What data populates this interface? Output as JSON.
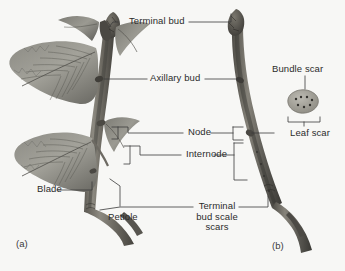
{
  "figure": {
    "type": "botany-twig-diagram",
    "background_color": "#f7f7f5",
    "ink_color": "#2b2b2b",
    "panels": [
      {
        "id": "a",
        "label": "(a)",
        "description": "leafy twig with blade and petiole"
      },
      {
        "id": "b",
        "label": "(b)",
        "description": "bare winter twig"
      }
    ],
    "labels": [
      {
        "id": "terminal-bud",
        "text": "Terminal bud"
      },
      {
        "id": "axillary-bud",
        "text": "Axillary bud"
      },
      {
        "id": "node",
        "text": "Node"
      },
      {
        "id": "internode",
        "text": "Internode"
      },
      {
        "id": "blade",
        "text": "Blade"
      },
      {
        "id": "petiole",
        "text": "Petiole"
      },
      {
        "id": "bundle-scar",
        "text": "Bundle scar"
      },
      {
        "id": "leaf-scar",
        "text": "Leaf scar"
      },
      {
        "id": "terminal-bud-scale-scars",
        "text": "Terminal bud scale scars"
      }
    ],
    "inset": {
      "id": "leaf-scar-inset",
      "bundle_scar_dot_count": 7,
      "shape": "heart"
    }
  }
}
